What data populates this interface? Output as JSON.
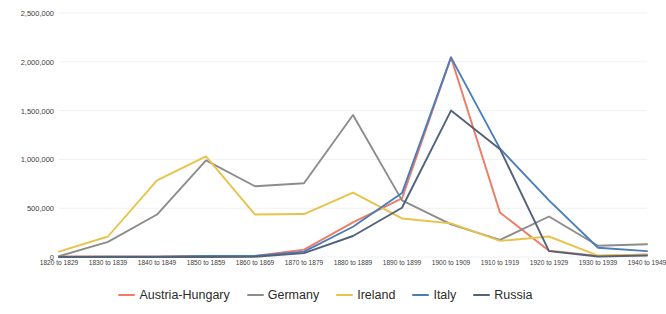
{
  "chart_data": {
    "type": "line",
    "title": "",
    "subtitle": "",
    "xlabel": "",
    "ylabel": "",
    "ylim": [
      0,
      2500000
    ],
    "ytick_step": 500000,
    "grid": true,
    "grid_axis": "y",
    "legend_position": "bottom",
    "ytick_labels": [
      "2,500,000",
      "2,000,000",
      "1,500,000",
      "1,000,000",
      "500,000",
      "0"
    ],
    "ytick_values": [
      2500000,
      2000000,
      1500000,
      1000000,
      500000,
      0
    ],
    "categories": [
      "1820 to 1829",
      "1830 to 1839",
      "1840 to 1849",
      "1850 to 1859",
      "1860 to 1869",
      "1870 to 1879",
      "1880 to 1889",
      "1890 to 1899",
      "1900 to 1909",
      "1910 to 1919",
      "1920 to 1929",
      "1930 to 1939",
      "1940 to 1949"
    ],
    "series": [
      {
        "name": "Austria-Hungary",
        "color": "#ED7D66",
        "values": [
          5000,
          5000,
          5000,
          10000,
          10000,
          75000,
          355000,
          600000,
          2045000,
          455000,
          65000,
          12000,
          25000
        ]
      },
      {
        "name": "Germany",
        "color": "#8C8C8C",
        "values": [
          8000,
          155000,
          435000,
          990000,
          725000,
          755000,
          1455000,
          580000,
          335000,
          175000,
          415000,
          115000,
          130000
        ]
      },
      {
        "name": "Ireland",
        "color": "#E8C34A",
        "values": [
          55000,
          210000,
          785000,
          1030000,
          435000,
          440000,
          660000,
          395000,
          345000,
          165000,
          210000,
          15000,
          20000
        ]
      },
      {
        "name": "Italy",
        "color": "#4A7EBB",
        "values": [
          500,
          2000,
          2000,
          10000,
          12000,
          55000,
          310000,
          655000,
          2045000,
          1110000,
          580000,
          95000,
          60000
        ]
      },
      {
        "name": "Russia",
        "color": "#53617A",
        "values": [
          500,
          500,
          500,
          500,
          2000,
          40000,
          215000,
          505000,
          1500000,
          1105000,
          60000,
          5000,
          15000
        ]
      }
    ]
  },
  "legend": {
    "items": [
      {
        "label": "Austria-Hungary",
        "color": "#ED7D66"
      },
      {
        "label": "Germany",
        "color": "#8C8C8C"
      },
      {
        "label": "Ireland",
        "color": "#E8C34A"
      },
      {
        "label": "Italy",
        "color": "#4A7EBB"
      },
      {
        "label": "Russia",
        "color": "#53617A"
      }
    ]
  },
  "style": {
    "grid_color": "#F0F0F0",
    "background": "#FFFFFF",
    "tick_text_color": "#404040"
  }
}
